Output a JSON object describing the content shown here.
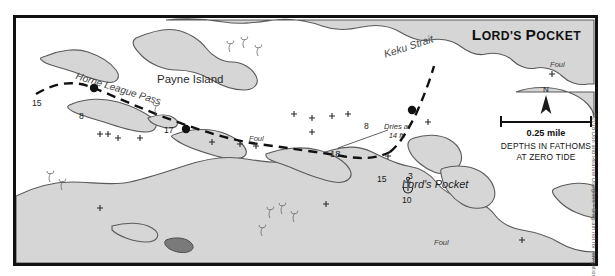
{
  "chart": {
    "title": "LORD'S POCKET",
    "title_caps": "L",
    "title_rest": "ORD'S ",
    "title_caps2": "P",
    "title_rest2": "OCKET"
  },
  "places": [
    {
      "name": "Payne Island",
      "style": "place"
    },
    {
      "name": "Keku Strait",
      "style": "water"
    },
    {
      "name": "Horne League Pass",
      "style": "pass"
    },
    {
      "name": "Lord's Pocket",
      "style": "pocket"
    }
  ],
  "labels": {
    "payne_island": "Payne Island",
    "keku_strait": "Keku Strait",
    "horne_league_pass": "Horne League Pass",
    "lords_pocket": "Lord's Pocket"
  },
  "hazards": [
    {
      "label": "Foul",
      "x": 247,
      "y": 122
    },
    {
      "label": "Foul",
      "x": 551,
      "y": 64
    },
    {
      "label": "Foul",
      "x": 432,
      "y": 238
    }
  ],
  "hazard_labels": {
    "foul_mid": "Foul",
    "foul_topright": "Foul",
    "foul_bottom": "Foul",
    "dries_line1": "Dries at",
    "dries_line2": "14 ft."
  },
  "soundings": [
    {
      "value": "15",
      "x": 30,
      "y": 99
    },
    {
      "value": "8",
      "x": 77,
      "y": 112
    },
    {
      "value": "17",
      "x": 162,
      "y": 126
    },
    {
      "value": "18",
      "x": 328,
      "y": 149
    },
    {
      "value": "8",
      "x": 362,
      "y": 122
    },
    {
      "value": "15",
      "x": 375,
      "y": 175
    },
    {
      "value": "3",
      "x": 406,
      "y": 172
    },
    {
      "value": "10",
      "x": 400,
      "y": 196
    }
  ],
  "sounding_values": {
    "s1": "15",
    "s2": "8",
    "s3": "17",
    "s4": "18",
    "s5": "8",
    "s6": "15",
    "s7": "3",
    "s8": "10"
  },
  "legend": {
    "north_letter": "N",
    "scale_value": "0.25 mile",
    "depth_note_line1": "DEPTHS IN FATHOMS",
    "depth_note_line2": "AT ZERO TIDE"
  },
  "credit": "©2018 Don and Réanne Douglass • Diagram not for navigation",
  "colors": {
    "land_fill": "#d6d6d6",
    "land_stroke": "#5a5a5a",
    "border": "#111111",
    "route": "#111111",
    "text": "#1a1a1a"
  }
}
